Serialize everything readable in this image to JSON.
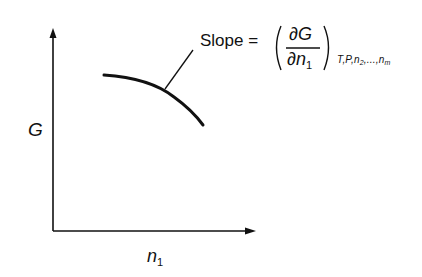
{
  "diagram": {
    "y_axis_label": "G",
    "x_axis_label": "n",
    "x_axis_label_subscript": "1",
    "annotation": {
      "slope_word": "Slope =",
      "numerator_partial": "∂",
      "numerator_var": "G",
      "denominator_partial": "∂",
      "denominator_var": "n",
      "denominator_subscript": "1",
      "held_constant": "T,P,n",
      "held_constant_sub2": "2",
      "held_constant_ellipsis": ",...,n",
      "held_constant_subm": "m"
    },
    "curve": "concave-down decreasing segment",
    "colors": {
      "ink": "#111111",
      "background": "#ffffff"
    }
  }
}
